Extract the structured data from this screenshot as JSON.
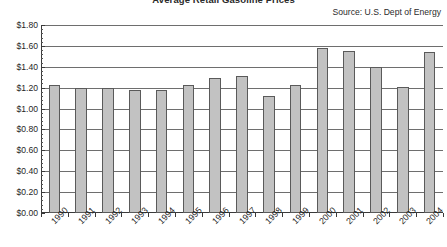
{
  "chart_data": {
    "type": "bar",
    "title": "Average Retail Gasoline Prices",
    "subtitle": "",
    "annotation": "Source: U.S. Dept of Energy",
    "xlabel": "",
    "ylabel": "",
    "categories": [
      "1990",
      "1991",
      "1992",
      "1993",
      "1994",
      "1995",
      "1996",
      "1997",
      "1998",
      "1999",
      "2000",
      "2001",
      "2002",
      "2003",
      "2004"
    ],
    "values": [
      1.23,
      1.2,
      1.2,
      1.18,
      1.18,
      1.23,
      1.29,
      1.31,
      1.12,
      1.23,
      1.58,
      1.55,
      1.4,
      1.21,
      1.54
    ],
    "ylim": [
      0,
      1.8
    ],
    "ytick_step": 0.2,
    "ytick_labels": [
      "$1.80",
      "$1.60",
      "$1.40",
      "$1.20",
      "$1.00",
      "$0.80",
      "$0.60",
      "$0.40",
      "$0.20",
      "$0.00"
    ],
    "ytick_values": [
      1.8,
      1.6,
      1.4,
      1.2,
      1.0,
      0.8,
      0.6,
      0.4,
      0.2,
      0.0
    ],
    "grid": true,
    "legend": false,
    "legend_position": "none",
    "bar_color": "#c2c2c2",
    "bar_border_color": "#5a5a5a",
    "grid_color": "#6e6e6e",
    "axis_color": "#3a3a3a",
    "plot_background": "#ffffff",
    "xlabel_rotation": -45
  }
}
